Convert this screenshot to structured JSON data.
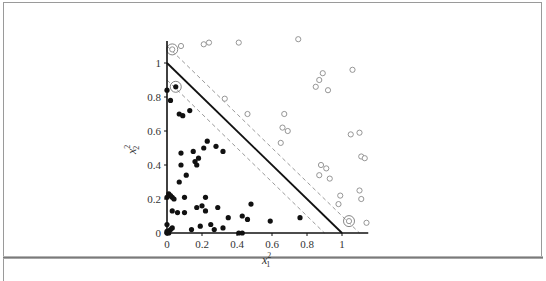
{
  "figure": {
    "xlabel": "x",
    "xlabel_superscript": "2",
    "xlabel_subscript": "1",
    "ylabel": "x",
    "ylabel_superscript": "2",
    "ylabel_subscript": "2"
  },
  "chart_data": {
    "type": "scatter",
    "title": "",
    "xlabel": "x_1^2",
    "ylabel": "x_2^2",
    "xlim": [
      0,
      1.15
    ],
    "ylim": [
      0,
      1.13
    ],
    "grid": false,
    "legend": null,
    "x_ticks": [
      "0",
      "0.2",
      "0.4",
      "0.6",
      "0.8",
      "1"
    ],
    "y_ticks": [
      "0",
      "0.2",
      "0.4",
      "0.6",
      "0.8",
      "1"
    ],
    "lines": [
      {
        "name": "decision boundary",
        "style": "solid",
        "color": "#111111",
        "equation": "x + y = 1"
      },
      {
        "name": "margin upper",
        "style": "dashed",
        "color": "#9a9a9a",
        "equation": "x + y = 1.1"
      },
      {
        "name": "margin lower",
        "style": "dashed",
        "color": "#9a9a9a",
        "equation": "x + y = 0.9"
      }
    ],
    "series": [
      {
        "name": "class -1 (filled)",
        "marker": "filled-circle",
        "color": "#111111",
        "points": [
          [
            0.0,
            0.84
          ],
          [
            0.02,
            0.78
          ],
          [
            0.05,
            0.86
          ],
          [
            0.07,
            0.7
          ],
          [
            0.09,
            0.69
          ],
          [
            0.13,
            0.72
          ],
          [
            0.08,
            0.47
          ],
          [
            0.15,
            0.48
          ],
          [
            0.23,
            0.54
          ],
          [
            0.32,
            0.48
          ],
          [
            0.28,
            0.51
          ],
          [
            0.08,
            0.4
          ],
          [
            0.16,
            0.42
          ],
          [
            0.17,
            0.4
          ],
          [
            0.11,
            0.34
          ],
          [
            0.18,
            0.44
          ],
          [
            0.21,
            0.5
          ],
          [
            0.07,
            0.3
          ],
          [
            0.01,
            0.23
          ],
          [
            0.02,
            0.22
          ],
          [
            0.03,
            0.21
          ],
          [
            0.04,
            0.2
          ],
          [
            0.0,
            0.21
          ],
          [
            0.1,
            0.21
          ],
          [
            0.22,
            0.21
          ],
          [
            0.03,
            0.13
          ],
          [
            0.06,
            0.12
          ],
          [
            0.1,
            0.12
          ],
          [
            0.17,
            0.15
          ],
          [
            0.2,
            0.16
          ],
          [
            0.22,
            0.13
          ],
          [
            0.29,
            0.15
          ],
          [
            0.35,
            0.09
          ],
          [
            0.43,
            0.1
          ],
          [
            0.46,
            0.08
          ],
          [
            0.48,
            0.17
          ],
          [
            0.59,
            0.07
          ],
          [
            0.76,
            0.09
          ],
          [
            0.25,
            0.05
          ],
          [
            0.19,
            0.04
          ],
          [
            0.14,
            0.02
          ],
          [
            0.27,
            0.02
          ],
          [
            0.32,
            0.03
          ],
          [
            0.0,
            0.05
          ],
          [
            0.01,
            0.01
          ],
          [
            0.02,
            0.02
          ],
          [
            0.03,
            0.03
          ],
          [
            0.01,
            0.0
          ],
          [
            0.0,
            0.01
          ],
          [
            0.41,
            0.0
          ],
          [
            0.43,
            0.0
          ],
          [
            0.0,
            0.0
          ]
        ]
      },
      {
        "name": "class +1 (hollow)",
        "marker": "open-circle",
        "color": "#8a8a8a",
        "points": [
          [
            0.03,
            1.08
          ],
          [
            0.08,
            1.1
          ],
          [
            0.21,
            1.11
          ],
          [
            0.24,
            1.12
          ],
          [
            0.41,
            1.12
          ],
          [
            0.75,
            1.14
          ],
          [
            0.33,
            0.79
          ],
          [
            0.46,
            0.7
          ],
          [
            0.67,
            0.7
          ],
          [
            0.66,
            0.62
          ],
          [
            0.69,
            0.6
          ],
          [
            0.65,
            0.53
          ],
          [
            0.87,
            0.9
          ],
          [
            0.89,
            0.94
          ],
          [
            0.85,
            0.86
          ],
          [
            0.92,
            0.84
          ],
          [
            1.06,
            0.96
          ],
          [
            0.88,
            0.4
          ],
          [
            0.91,
            0.38
          ],
          [
            0.87,
            0.34
          ],
          [
            0.93,
            0.32
          ],
          [
            1.05,
            0.58
          ],
          [
            1.1,
            0.59
          ],
          [
            0.99,
            0.22
          ],
          [
            0.98,
            0.17
          ],
          [
            1.11,
            0.45
          ],
          [
            1.13,
            0.44
          ],
          [
            1.1,
            0.25
          ],
          [
            1.11,
            0.2
          ],
          [
            1.04,
            0.07
          ],
          [
            1.14,
            0.06
          ]
        ]
      }
    ],
    "support_vectors": [
      {
        "class": "+1",
        "point": [
          0.03,
          1.08
        ]
      },
      {
        "class": "-1",
        "point": [
          0.05,
          0.86
        ]
      },
      {
        "class": "+1",
        "point": [
          1.04,
          0.07
        ]
      }
    ]
  }
}
